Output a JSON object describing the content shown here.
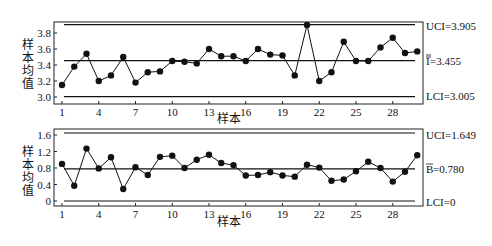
{
  "chart_data": [
    {
      "type": "line",
      "title": "",
      "xlabel": "样本",
      "ylabel": "样本均值",
      "x": [
        1,
        2,
        3,
        4,
        5,
        6,
        7,
        8,
        9,
        10,
        11,
        12,
        13,
        14,
        15,
        16,
        17,
        18,
        19,
        20,
        21,
        22,
        23,
        24,
        25,
        26,
        27,
        28,
        29,
        30
      ],
      "values": [
        3.15,
        3.38,
        3.54,
        3.2,
        3.27,
        3.5,
        3.18,
        3.31,
        3.32,
        3.45,
        3.44,
        3.42,
        3.6,
        3.51,
        3.51,
        3.45,
        3.6,
        3.53,
        3.52,
        3.27,
        3.9,
        3.2,
        3.31,
        3.69,
        3.45,
        3.45,
        3.62,
        3.74,
        3.55,
        3.57
      ],
      "xticks": [
        "1",
        "4",
        "7",
        "10",
        "13",
        "16",
        "19",
        "22",
        "25",
        "28"
      ],
      "yticks": [
        "3.0",
        "3.2",
        "3.4",
        "3.6",
        "3.8"
      ],
      "ylim": [
        2.97,
        3.95
      ],
      "control_lines": {
        "ucl": {
          "value": 3.905,
          "label": "UCI=3.905"
        },
        "center": {
          "value": 3.455,
          "label": "=3.455",
          "symbol": "I"
        },
        "lcl": {
          "value": 3.005,
          "label": "LCI=3.005"
        }
      },
      "grid": false
    },
    {
      "type": "line",
      "title": "",
      "xlabel": "样本",
      "ylabel": "样本均值",
      "x": [
        1,
        2,
        3,
        4,
        5,
        6,
        7,
        8,
        9,
        10,
        11,
        12,
        13,
        14,
        15,
        16,
        17,
        18,
        19,
        20,
        21,
        22,
        23,
        24,
        25,
        26,
        27,
        28,
        29,
        30
      ],
      "values": [
        0.9,
        0.37,
        1.27,
        0.79,
        1.06,
        0.29,
        0.82,
        0.63,
        1.07,
        1.1,
        0.8,
        1.0,
        1.12,
        0.92,
        0.87,
        0.62,
        0.63,
        0.7,
        0.62,
        0.59,
        0.88,
        0.81,
        0.49,
        0.52,
        0.72,
        0.95,
        0.8,
        0.47,
        0.71,
        1.11
      ],
      "xticks": [
        "1",
        "4",
        "7",
        "10",
        "13",
        "16",
        "19",
        "22",
        "25",
        "28"
      ],
      "yticks": [
        "0",
        "0.4",
        "0.8",
        "1.2",
        "1.6"
      ],
      "ylim": [
        -0.1,
        1.75
      ],
      "control_lines": {
        "ucl": {
          "value": 1.649,
          "label": "UCI=1.649"
        },
        "center": {
          "value": 0.78,
          "label": "=0.780",
          "symbol": "B"
        },
        "lcl": {
          "value": 0,
          "label": "LCI=0"
        }
      },
      "grid": false
    }
  ],
  "labels": {
    "ylabel_chars": [
      "样",
      "本",
      "均",
      "值"
    ],
    "xlabel": "样本",
    "top_ucl": "UCI=3.905",
    "top_center_symbol": "I",
    "top_center_value": "=3.455",
    "top_lcl": "LCI=3.005",
    "bottom_ucl": "UCI=1.649",
    "bottom_center_symbol": "B",
    "bottom_center_value": "=0.780",
    "bottom_lcl": "LCI=0"
  },
  "colors": {
    "line": "#111111",
    "frame": "#222222",
    "background": "#ffffff"
  }
}
